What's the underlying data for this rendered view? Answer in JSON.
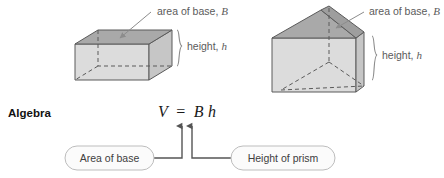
{
  "figure": {
    "title_row": {
      "algebra_label": "Algebra"
    },
    "shapes": [
      {
        "name": "rectangular-prism",
        "base_label": "area of base, ",
        "base_label_var": "B",
        "height_label": "height, ",
        "height_label_var": "h"
      },
      {
        "name": "triangular-prism",
        "base_label": "area of base, ",
        "base_label_var": "B",
        "height_label": "height, ",
        "height_label_var": "h"
      }
    ],
    "formula": {
      "volume_var": "V",
      "equals": "=",
      "base_var": "B",
      "height_var": "h",
      "full": "V = Bh"
    },
    "callouts": [
      {
        "name": "area-of-base",
        "label": "Area of base"
      },
      {
        "name": "height-of-prism",
        "label": "Height of prism"
      }
    ],
    "colors": {
      "top_face": "#a9a9a9",
      "front_face": "#d9d9d9",
      "side_face": "#c4c4c4",
      "outline": "#555555",
      "label_text": "#5b5b5b",
      "leader_line": "#8c8c8c",
      "callout_border": "#bdbdbd",
      "arrow": "#555555",
      "background": "#ffffff"
    }
  }
}
